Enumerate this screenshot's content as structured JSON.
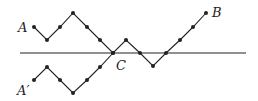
{
  "diagram": {
    "colors": {
      "stroke": "#222222",
      "background": "#ffffff"
    },
    "axis": {
      "x1": 20,
      "y1": 53,
      "x2": 246,
      "y2": 53
    },
    "path_A": {
      "label": "A",
      "points": [
        [
          34,
          27
        ],
        [
          47,
          40
        ],
        [
          60,
          27
        ],
        [
          73,
          13
        ],
        [
          87,
          27
        ],
        [
          100,
          40
        ],
        [
          113,
          53
        ],
        [
          126,
          40
        ],
        [
          140,
          53
        ],
        [
          153,
          66
        ],
        [
          166,
          53
        ],
        [
          180,
          40
        ],
        [
          193,
          27
        ],
        [
          206,
          13
        ]
      ]
    },
    "path_A_prime": {
      "label": "A′",
      "points": [
        [
          34,
          80
        ],
        [
          47,
          67
        ],
        [
          60,
          80
        ],
        [
          73,
          93
        ],
        [
          87,
          80
        ],
        [
          100,
          67
        ],
        [
          113,
          53
        ]
      ]
    },
    "labels": {
      "A": {
        "text": "A",
        "x": 18,
        "y": 32
      },
      "A_prime": {
        "text": "A′",
        "x": 17,
        "y": 95
      },
      "B": {
        "text": "B",
        "x": 212,
        "y": 17
      },
      "C": {
        "text": "C",
        "x": 116,
        "y": 70
      }
    }
  }
}
